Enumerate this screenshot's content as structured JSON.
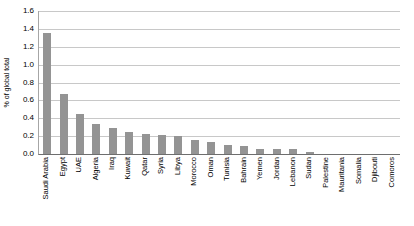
{
  "chart_data": {
    "type": "bar",
    "title": "",
    "xlabel": "",
    "ylabel": "% of global total",
    "ylim": [
      0.0,
      1.6
    ],
    "ytick_labels": [
      "1.6",
      "1.4",
      "1.2",
      "1.0",
      "0.8",
      "0.6",
      "0.4",
      "0.2",
      "0.0"
    ],
    "ytick_values": [
      1.6,
      1.4,
      1.2,
      1.0,
      0.8,
      0.6,
      0.4,
      0.2,
      0.0
    ],
    "grid": true,
    "legend": false,
    "bar_color": "#949494",
    "categories": [
      "Saudi Arabia",
      "Egypt",
      "UAE",
      "Algeria",
      "Iraq",
      "Kuwait",
      "Qatar",
      "Syria",
      "Libya",
      "Morocco",
      "Oman",
      "Tunisia",
      "Bahrain",
      "Yemen",
      "Jordan",
      "Lebanon",
      "Sudan",
      "Palestine",
      "Mauritania",
      "Somalia",
      "Djibouti",
      "Comoros"
    ],
    "values": [
      1.35,
      0.67,
      0.45,
      0.34,
      0.29,
      0.25,
      0.22,
      0.21,
      0.2,
      0.16,
      0.14,
      0.1,
      0.09,
      0.06,
      0.06,
      0.06,
      0.02,
      0.0,
      0.0,
      0.0,
      0.0,
      0.0
    ]
  }
}
